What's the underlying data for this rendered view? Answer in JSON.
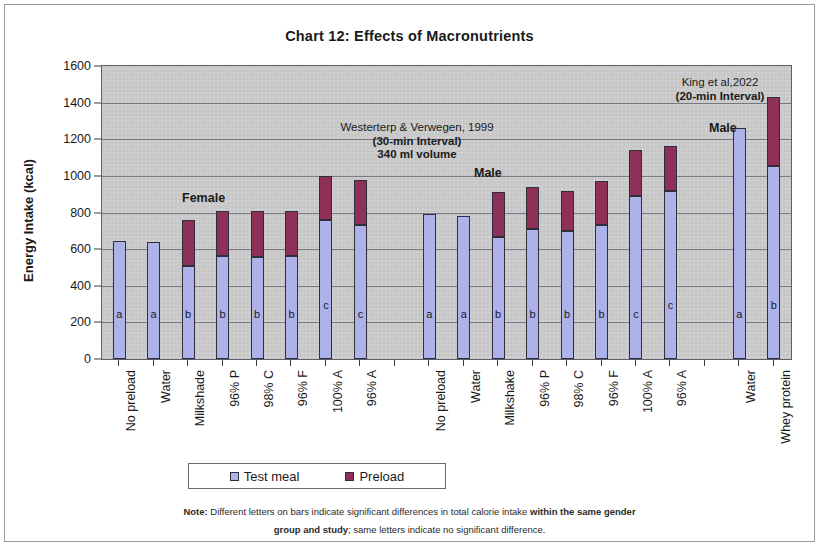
{
  "chart_data": {
    "type": "bar",
    "title": "Chart 12: Effects of Macronutrients",
    "xlabel": "",
    "ylabel": "Energy Intake (kcal)",
    "ylim": [
      0,
      1600
    ],
    "yticks": [
      0,
      200,
      400,
      600,
      800,
      1000,
      1200,
      1400,
      1600
    ],
    "grid": true,
    "stacked": true,
    "legend_position": "bottom",
    "legend": [
      "Test meal",
      "Preload"
    ],
    "colors": {
      "test_meal": "#adb2e8",
      "preload": "#8e3058",
      "plot_background": "#c9c9c9"
    },
    "categories": [
      "No preload",
      "Water",
      "Milkshade",
      "96% P",
      "98% C",
      "96% F",
      "100% A",
      "96% A",
      "",
      "No preload",
      "Water",
      "Milkshake",
      "96% P",
      "98% C",
      "96% F",
      "100% A",
      "96% A",
      "",
      "Water",
      "Whey protein"
    ],
    "series": [
      {
        "name": "Test meal",
        "values": [
          645,
          640,
          510,
          560,
          555,
          565,
          760,
          730,
          null,
          790,
          780,
          665,
          710,
          700,
          730,
          890,
          920,
          null,
          1260,
          1055
        ]
      },
      {
        "name": "Preload",
        "values": [
          0,
          0,
          250,
          250,
          255,
          245,
          240,
          245,
          null,
          0,
          0,
          245,
          230,
          220,
          240,
          250,
          245,
          null,
          0,
          375
        ]
      }
    ],
    "totals": [
      645,
      640,
      760,
      810,
      810,
      810,
      1000,
      975,
      null,
      790,
      780,
      910,
      940,
      920,
      970,
      1140,
      1165,
      null,
      1260,
      1430
    ],
    "bar_letters": [
      "a",
      "a",
      "b",
      "b",
      "b",
      "b",
      "c",
      "c",
      "",
      "a",
      "a",
      "b",
      "b",
      "b",
      "b",
      "c",
      "c",
      "",
      "a",
      "b"
    ],
    "annotations": [
      {
        "id": "study-westerterp",
        "lines": [
          "Westerterp & Verwegen, 1999",
          "(30-min Interval)",
          "340 ml volume"
        ]
      },
      {
        "id": "study-king",
        "lines": [
          "King et al,2022",
          "(20-min Interval)"
        ]
      },
      {
        "id": "group-female",
        "text": "Female"
      },
      {
        "id": "group-male",
        "text": "Male"
      },
      {
        "id": "group-male-king",
        "text": "Male"
      }
    ],
    "note": {
      "line1_bold_lead": "Note:",
      "line1_text": " Different letters on bars indicate significant differences in total calorie intake ",
      "line1_bold_tail": "within the same gender",
      "line2_bold_lead": "group and study",
      "line2_text": "; same letters indicate no significant difference."
    }
  }
}
